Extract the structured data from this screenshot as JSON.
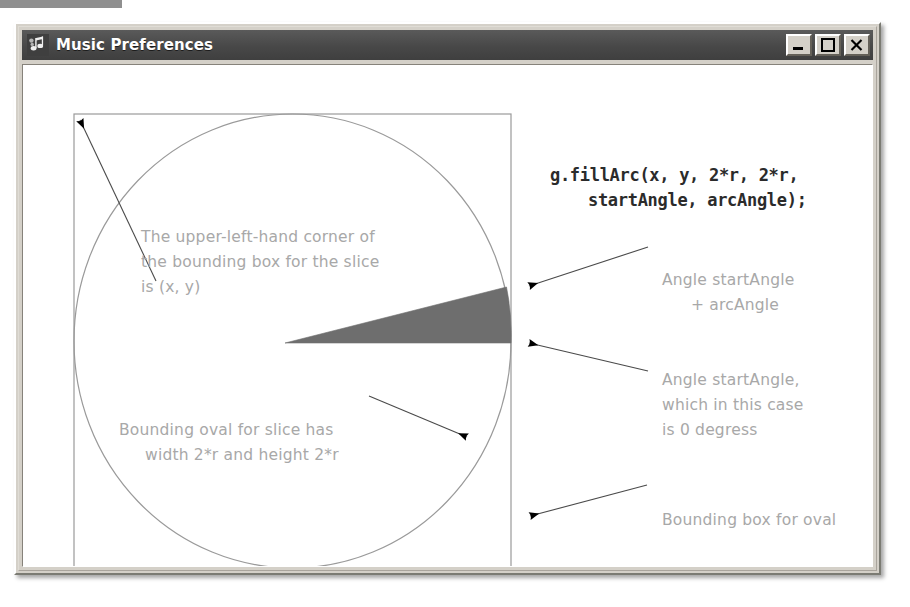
{
  "window": {
    "title": "Music Preferences",
    "icon": "music-note-icon",
    "controls": [
      {
        "name": "minimize-button",
        "glyph": "minimize-icon",
        "label": "_"
      },
      {
        "name": "maximize-button",
        "glyph": "maximize-icon",
        "label": "□"
      },
      {
        "name": "close-button",
        "glyph": "close-icon",
        "label": "×"
      }
    ],
    "titlebar_color": "#4c4c4c",
    "frame_color": "#d4d0c8",
    "client_color": "#ffffff"
  },
  "code": {
    "line1": "g.fillArc(x, y, 2*r, 2*r,",
    "line2": "startAngle, arcAngle);"
  },
  "annotations": {
    "upper_left": {
      "line1": "The upper-left-hand corner of",
      "line2": "the bounding box for the slice",
      "line3": "is (x, y)"
    },
    "lower_left": {
      "line1": "Bounding oval for slice has",
      "line2": "width 2*r and height 2*r"
    },
    "arc_end": {
      "line1": "Angle startAngle",
      "line2": "+ arcAngle"
    },
    "arc_start": {
      "line1": "Angle startAngle,",
      "line2": "which in this case",
      "line3": "is 0 degress"
    },
    "bounding_box": {
      "line1": "Bounding box for oval"
    }
  },
  "figure": {
    "type": "diagram",
    "bounding_box": {
      "x": 57,
      "y": 89,
      "width": 437,
      "height": 454
    },
    "oval": {
      "cx": 275.5,
      "cy": 316,
      "rx": 218.5,
      "ry": 227
    },
    "slice": {
      "apex_x": 268,
      "apex_y": 318,
      "start_angle_deg": 0,
      "arc_angle_deg": 14,
      "fill_color": "#6e6e6e"
    },
    "colors": {
      "outline": "#8a8a8a",
      "slice": "#6e6e6e",
      "annotation_text": "#a8a8a8",
      "code_text": "#2b2b2b",
      "arrow": "#000000"
    },
    "arrows": [
      {
        "name": "arrow-to-box-corner",
        "from": [
          139,
          256
        ],
        "to": [
          60,
          92
        ]
      },
      {
        "name": "arrow-to-oval-edge",
        "from": [
          352,
          371
        ],
        "to": [
          452,
          414
        ]
      },
      {
        "name": "arrow-to-arc-end",
        "from": [
          631,
          222
        ],
        "to": [
          508,
          262
        ]
      },
      {
        "name": "arrow-to-arc-start",
        "from": [
          631,
          346
        ],
        "to": [
          508,
          318
        ]
      },
      {
        "name": "arrow-to-bounding-box",
        "from": [
          630,
          460
        ],
        "to": [
          509,
          492
        ]
      }
    ]
  }
}
